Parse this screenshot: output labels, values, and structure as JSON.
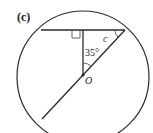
{
  "figure": {
    "part_label": "(c)",
    "center_label": "O",
    "unknown_angle_label": "c",
    "given_angle_label": "35°",
    "given_angle_degrees": 35,
    "right_angle_marker": true,
    "colors": {
      "stroke": "#2a2a2a",
      "background": "#ffffff"
    }
  }
}
